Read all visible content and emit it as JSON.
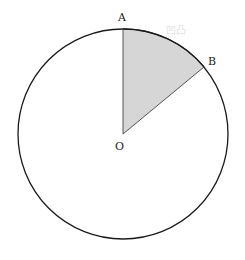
{
  "diagram": {
    "type": "circle-sector",
    "circle": {
      "cx": 123,
      "cy": 134,
      "r": 105,
      "stroke": "#1a1a1a"
    },
    "sector": {
      "from_point": "A",
      "to_point": "B",
      "fill": "#d6d6d6",
      "stroke": "#555555"
    },
    "points": {
      "O": {
        "label": "O",
        "x": 123,
        "y": 134
      },
      "A": {
        "label": "A",
        "x": 123,
        "y": 29
      },
      "B": {
        "label": "B",
        "x": 204,
        "y": 67
      }
    },
    "watermark": "凹凸"
  }
}
